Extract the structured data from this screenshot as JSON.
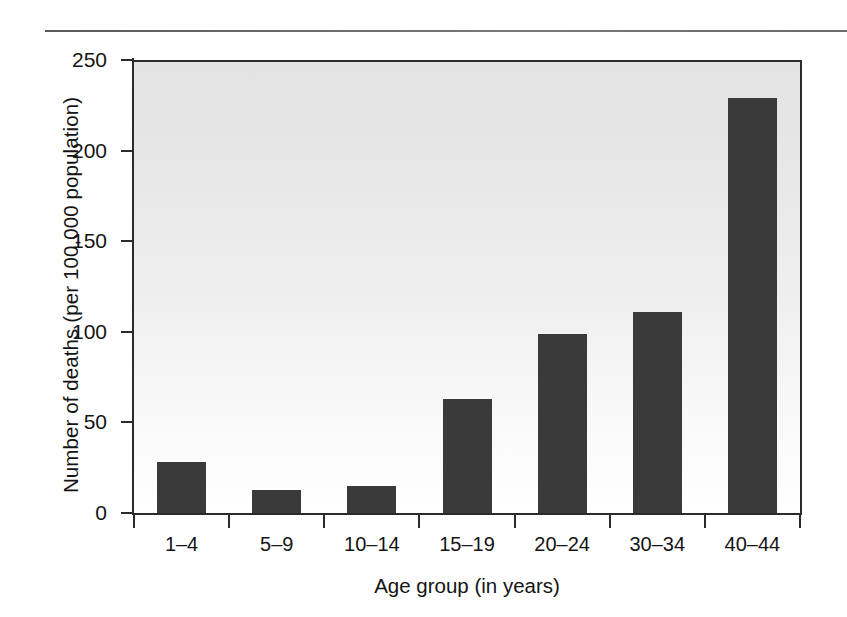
{
  "chart_data": {
    "type": "bar",
    "title": "",
    "subtitle": "",
    "xlabel": "Age group (in years)",
    "ylabel": "Number of deaths (per 100,000 population)",
    "categories": [
      "1–4",
      "5–9",
      "10–14",
      "15–19",
      "20–24",
      "30–34",
      "40–44"
    ],
    "values": [
      29,
      14,
      16,
      64,
      100,
      112,
      230
    ],
    "ylim": [
      0,
      250
    ],
    "yticks": [
      0,
      50,
      100,
      150,
      200,
      250
    ],
    "ytick_labels": [
      "0",
      "50",
      "100",
      "150",
      "200",
      "250"
    ],
    "grid": false,
    "legend": null,
    "legend_position": "none",
    "bar_color": "#3a3a3a",
    "plot_bg_top": "#e3e3e3",
    "plot_bg_bottom": "#ffffff",
    "axis_color": "#2b2b2b",
    "text_color": "#141414",
    "annotations": []
  },
  "figure": {
    "top_rule": "horizontal-rule"
  }
}
